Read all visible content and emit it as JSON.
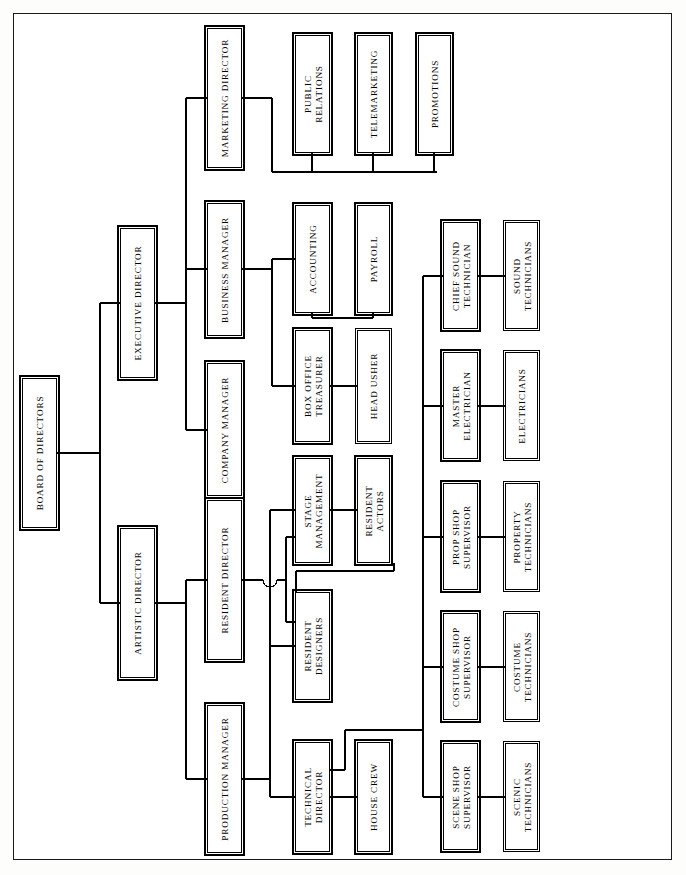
{
  "chart": {
    "type": "diagram",
    "diagram_kind": "organizational-chart",
    "orientation": "rotated-90-ccw",
    "title": "",
    "nodes": [
      {
        "id": "board",
        "label": "BOARD OF DIRECTORS",
        "x": 22,
        "y": 378,
        "w": 35,
        "h": 150,
        "emphasis": "heavy"
      },
      {
        "id": "exec",
        "label": "EXECUTIVE DIRECTOR",
        "x": 120,
        "y": 228,
        "w": 35,
        "h": 150,
        "emphasis": "heavy"
      },
      {
        "id": "artistic",
        "label": "ARTISTIC DIRECTOR",
        "x": 120,
        "y": 528,
        "w": 35,
        "h": 150,
        "emphasis": "heavy"
      },
      {
        "id": "marketing",
        "label": "MARKETING DIRECTOR",
        "x": 207,
        "y": 28,
        "w": 35,
        "h": 140,
        "emphasis": "heavy"
      },
      {
        "id": "business",
        "label": "BUSINESS MANAGER",
        "x": 207,
        "y": 203,
        "w": 35,
        "h": 133,
        "emphasis": "heavy"
      },
      {
        "id": "company",
        "label": "COMPANY MANAGER",
        "x": 207,
        "y": 363,
        "w": 35,
        "h": 133,
        "emphasis": "heavy"
      },
      {
        "id": "resident_dir",
        "label": "RESIDENT DIRECTOR",
        "x": 207,
        "y": 500,
        "w": 35,
        "h": 160,
        "emphasis": "heavy"
      },
      {
        "id": "production",
        "label": "PRODUCTION MANAGER",
        "x": 207,
        "y": 705,
        "w": 35,
        "h": 148,
        "emphasis": "heavy"
      },
      {
        "id": "public_rel",
        "label": "PUBLIC\nRELATIONS",
        "x": 295,
        "y": 35,
        "w": 35,
        "h": 118,
        "emphasis": "heavy"
      },
      {
        "id": "telemkt",
        "label": "TELEMARKETING",
        "x": 357,
        "y": 35,
        "w": 33,
        "h": 118,
        "emphasis": "heavy"
      },
      {
        "id": "promotions",
        "label": "PROMOTIONS",
        "x": 418,
        "y": 35,
        "w": 33,
        "h": 118,
        "emphasis": "heavy"
      },
      {
        "id": "accounting",
        "label": "ACCOUNTING",
        "x": 295,
        "y": 205,
        "w": 35,
        "h": 108,
        "emphasis": "heavy"
      },
      {
        "id": "payroll",
        "label": "PAYROLL",
        "x": 357,
        "y": 205,
        "w": 33,
        "h": 108,
        "emphasis": "heavy"
      },
      {
        "id": "box_office",
        "label": "BOX OFFICE\nTREASURER",
        "x": 295,
        "y": 330,
        "w": 35,
        "h": 112,
        "emphasis": "heavy"
      },
      {
        "id": "head_usher",
        "label": "HEAD USHER",
        "x": 357,
        "y": 330,
        "w": 33,
        "h": 112,
        "emphasis": "thin"
      },
      {
        "id": "stage_mgmt",
        "label": "STAGE\nMANAGEMENT",
        "x": 295,
        "y": 458,
        "w": 35,
        "h": 105,
        "emphasis": "heavy"
      },
      {
        "id": "res_actors",
        "label": "RESIDENT\nACTORS",
        "x": 357,
        "y": 458,
        "w": 33,
        "h": 105,
        "emphasis": "heavy"
      },
      {
        "id": "res_design",
        "label": "RESIDENT\nDESIGNERS",
        "x": 295,
        "y": 592,
        "w": 35,
        "h": 108,
        "emphasis": "heavy"
      },
      {
        "id": "tech_dir",
        "label": "TECHNICAL\nDIRECTOR",
        "x": 295,
        "y": 742,
        "w": 35,
        "h": 110,
        "emphasis": "heavy"
      },
      {
        "id": "house_crew",
        "label": "HOUSE CREW",
        "x": 357,
        "y": 742,
        "w": 33,
        "h": 110,
        "emphasis": "heavy"
      },
      {
        "id": "chief_sound",
        "label": "CHIEF SOUND\nTECHNICIAN",
        "x": 443,
        "y": 222,
        "w": 35,
        "h": 107,
        "emphasis": "heavy"
      },
      {
        "id": "sound_tech",
        "label": "SOUND\nTECHNICIANS",
        "x": 505,
        "y": 222,
        "w": 33,
        "h": 107,
        "emphasis": "thin"
      },
      {
        "id": "master_elec",
        "label": "MASTER\nELECTRICIAN",
        "x": 443,
        "y": 352,
        "w": 35,
        "h": 107,
        "emphasis": "heavy"
      },
      {
        "id": "electricians",
        "label": "ELECTRICIANS",
        "x": 505,
        "y": 352,
        "w": 33,
        "h": 107,
        "emphasis": "thin"
      },
      {
        "id": "prop_shop",
        "label": "PROP SHOP\nSUPERVISOR",
        "x": 443,
        "y": 483,
        "w": 35,
        "h": 107,
        "emphasis": "heavy"
      },
      {
        "id": "prop_tech",
        "label": "PROPERTY\nTECHNICIANS",
        "x": 505,
        "y": 483,
        "w": 33,
        "h": 107,
        "emphasis": "thin"
      },
      {
        "id": "costume_shop",
        "label": "COSTUME SHOP\nSUPERVISOR",
        "x": 443,
        "y": 613,
        "w": 35,
        "h": 107,
        "emphasis": "heavy"
      },
      {
        "id": "costume_tech",
        "label": "COSTUME\nTECHNICIANS",
        "x": 505,
        "y": 613,
        "w": 33,
        "h": 107,
        "emphasis": "thin"
      },
      {
        "id": "scene_shop",
        "label": "SCENE SHOP\nSUPERVISOR",
        "x": 443,
        "y": 743,
        "w": 35,
        "h": 107,
        "emphasis": "heavy"
      },
      {
        "id": "scenic_tech",
        "label": "SCENIC\nTECHNICIANS",
        "x": 505,
        "y": 743,
        "w": 33,
        "h": 107,
        "emphasis": "thin"
      }
    ],
    "edges": [
      {
        "from": "board",
        "to": "exec"
      },
      {
        "from": "board",
        "to": "artistic"
      },
      {
        "from": "exec",
        "to": "marketing"
      },
      {
        "from": "exec",
        "to": "business"
      },
      {
        "from": "exec",
        "to": "company"
      },
      {
        "from": "artistic",
        "to": "resident_dir"
      },
      {
        "from": "artistic",
        "to": "production"
      },
      {
        "from": "marketing",
        "to": "public_rel"
      },
      {
        "from": "marketing",
        "to": "telemkt"
      },
      {
        "from": "marketing",
        "to": "promotions"
      },
      {
        "from": "business",
        "to": "accounting"
      },
      {
        "from": "business",
        "to": "box_office"
      },
      {
        "from": "accounting",
        "to": "payroll"
      },
      {
        "from": "box_office",
        "to": "head_usher"
      },
      {
        "from": "resident_dir",
        "to": "stage_mgmt"
      },
      {
        "from": "resident_dir",
        "to": "res_actors"
      },
      {
        "from": "stage_mgmt",
        "to": "res_actors"
      },
      {
        "from": "production",
        "to": "stage_mgmt"
      },
      {
        "from": "production",
        "to": "res_design"
      },
      {
        "from": "production",
        "to": "tech_dir"
      },
      {
        "from": "tech_dir",
        "to": "house_crew"
      },
      {
        "from": "tech_dir",
        "to": "chief_sound"
      },
      {
        "from": "tech_dir",
        "to": "master_elec"
      },
      {
        "from": "tech_dir",
        "to": "prop_shop"
      },
      {
        "from": "tech_dir",
        "to": "costume_shop"
      },
      {
        "from": "tech_dir",
        "to": "scene_shop"
      },
      {
        "from": "chief_sound",
        "to": "sound_tech"
      },
      {
        "from": "master_elec",
        "to": "electricians"
      },
      {
        "from": "prop_shop",
        "to": "prop_tech"
      },
      {
        "from": "costume_shop",
        "to": "costume_tech"
      },
      {
        "from": "scene_shop",
        "to": "scenic_tech"
      }
    ],
    "colors": {
      "line": "#000000",
      "box_border": "#000000",
      "box_fill": "#ffffff",
      "page_bg": "#ffffff",
      "frame": "#1a1a1a"
    }
  }
}
